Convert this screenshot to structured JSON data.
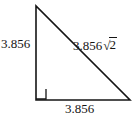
{
  "figure": {
    "name": "right-triangle-45-45-90",
    "background_color": "#ffffff",
    "stroke_color": "#141414",
    "geometry": {
      "apex": [
        36,
        6
      ],
      "right_angle_vertex": [
        36,
        100
      ],
      "bottom_right_vertex": [
        130,
        100
      ],
      "right_angle_marker_size": 10
    },
    "labels": {
      "vertical_leg": "3.856",
      "horizontal_leg": "3.856",
      "hypotenuse_coefficient": "3.856",
      "hypotenuse_radical_sign": "√",
      "hypotenuse_radicand": "2",
      "hypotenuse_full": "3.856√2"
    }
  }
}
